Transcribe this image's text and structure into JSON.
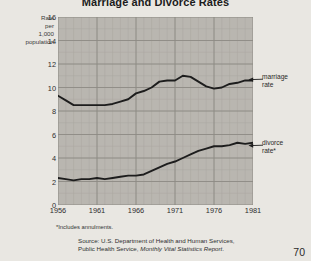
{
  "chart_data": {
    "type": "line",
    "title": "Marriage and Divorce Rates",
    "xlabel": "",
    "ylabel": "Rate per 1,000 population",
    "ylabel_lines": [
      "Rate",
      "per",
      "1,000",
      "population"
    ],
    "xlim": [
      1956,
      1981
    ],
    "ylim": [
      0,
      16
    ],
    "yticks": [
      0,
      2,
      4,
      6,
      8,
      10,
      12,
      14,
      16
    ],
    "xticks": [
      1956,
      1961,
      1966,
      1971,
      1976,
      1981
    ],
    "grid": true,
    "legend_position": "right-annotations",
    "x": [
      1956,
      1957,
      1958,
      1959,
      1960,
      1961,
      1962,
      1963,
      1964,
      1965,
      1966,
      1967,
      1968,
      1969,
      1970,
      1971,
      1972,
      1973,
      1974,
      1975,
      1976,
      1977,
      1978,
      1979,
      1980,
      1981
    ],
    "series": [
      {
        "name": "marriage rate",
        "label": "marriage\nrate",
        "color": "#1d1d1d",
        "values": [
          9.3,
          8.9,
          8.5,
          8.5,
          8.5,
          8.5,
          8.5,
          8.6,
          8.8,
          9.0,
          9.5,
          9.7,
          10.0,
          10.5,
          10.6,
          10.6,
          11.0,
          10.9,
          10.5,
          10.1,
          9.9,
          10.0,
          10.3,
          10.4,
          10.6,
          10.6
        ]
      },
      {
        "name": "divorce rate",
        "label": "divorce\nrate*",
        "color": "#1d1d1d",
        "values": [
          2.3,
          2.2,
          2.1,
          2.2,
          2.2,
          2.3,
          2.2,
          2.3,
          2.4,
          2.5,
          2.5,
          2.6,
          2.9,
          3.2,
          3.5,
          3.7,
          4.0,
          4.3,
          4.6,
          4.8,
          5.0,
          5.0,
          5.1,
          5.3,
          5.2,
          5.3
        ]
      }
    ],
    "footnote": "*Includes annulments.",
    "source_line1": "Source: U.S. Department of Health and Human Services,",
    "source_line2_prefix": "Public Health Service, ",
    "source_line2_italic": "Monthly Vital Statistics Report",
    "source_line2_suffix": ".",
    "colors": {
      "plot_background": "#b9b6b0",
      "page_background": "#e9e7e2",
      "grid_major": "#8d8a84",
      "grid_minor": "#aaa7a1",
      "line": "#1d1d1d"
    }
  },
  "page": {
    "number": "70"
  }
}
